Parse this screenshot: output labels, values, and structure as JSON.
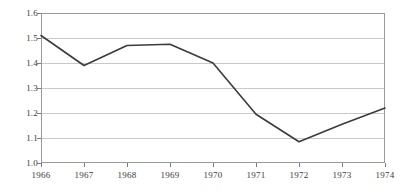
{
  "chart_data": {
    "type": "line",
    "title": "",
    "subtitle": "",
    "xlabel": "",
    "ylabel": "",
    "x": [
      1966,
      1967,
      1968,
      1969,
      1970,
      1971,
      1972,
      1973,
      1974
    ],
    "categories": [
      "1966",
      "1967",
      "1968",
      "1969",
      "1970",
      "1971",
      "1972",
      "1973",
      "1974"
    ],
    "values": [
      1.51,
      1.39,
      1.47,
      1.475,
      1.4,
      1.195,
      1.085,
      1.155,
      1.22
    ],
    "series": [
      {
        "name": "series-1",
        "values": [
          1.51,
          1.39,
          1.47,
          1.475,
          1.4,
          1.195,
          1.085,
          1.155,
          1.22
        ],
        "color": "#3b3b3b"
      }
    ],
    "ylim": [
      1.0,
      1.6
    ],
    "xlim": [
      1966,
      1974
    ],
    "ytick_labels": [
      "1.6",
      "1.5",
      "1.4",
      "1.3",
      "1.2",
      "1.1",
      "1.0"
    ],
    "ytick_values": [
      1.6,
      1.5,
      1.4,
      1.3,
      1.2,
      1.1,
      1.0
    ],
    "xtick_labels": [
      "1966",
      "1967",
      "1968",
      "1969",
      "1970",
      "1971",
      "1972",
      "1973",
      "1974"
    ],
    "grid": true,
    "grid_axis": "y",
    "grid_color": "#c9c9c9",
    "frame_color": "#9a9a9a",
    "legend": false,
    "legend_position": "none",
    "line_color": "#3b3b3b",
    "line_width": 1.6,
    "markers": false,
    "annotations": []
  },
  "ylabels": {
    "t0": "1.6",
    "t1": "1.5",
    "t2": "1.4",
    "t3": "1.3",
    "t4": "1.2",
    "t5": "1.1",
    "t6": "1.0"
  },
  "xlabels": {
    "t0": "1966",
    "t1": "1967",
    "t2": "1968",
    "t3": "1969",
    "t4": "1970",
    "t5": "1971",
    "t6": "1972",
    "t7": "1973",
    "t8": "1974"
  }
}
